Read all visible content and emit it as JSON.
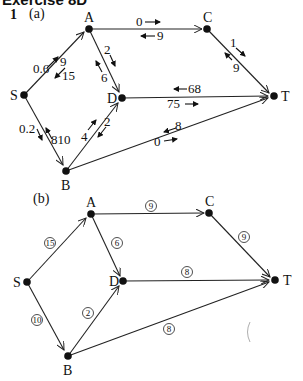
{
  "header": {
    "title": "Exercise 8D",
    "question_number": "1"
  },
  "part_a": {
    "label": "(a)",
    "nodes": [
      {
        "id": "A",
        "label": "A"
      },
      {
        "id": "C",
        "label": "C"
      },
      {
        "id": "S",
        "label": "S"
      },
      {
        "id": "D",
        "label": "D"
      },
      {
        "id": "T",
        "label": "T"
      },
      {
        "id": "B",
        "label": "B"
      }
    ],
    "edges": [
      {
        "from": "S",
        "to": "A",
        "forward": "0 6",
        "backward": "9 15"
      },
      {
        "from": "A",
        "to": "C",
        "forward": "0",
        "backward": "9"
      },
      {
        "from": "A",
        "to": "D",
        "forward": "2",
        "backward": "6"
      },
      {
        "from": "C",
        "to": "T",
        "forward": "1",
        "backward": "9"
      },
      {
        "from": "D",
        "to": "T",
        "forward": "7 5",
        "backward": "6 8"
      },
      {
        "from": "S",
        "to": "B",
        "forward": "0 2",
        "backward": "8 10"
      },
      {
        "from": "B",
        "to": "D",
        "forward": "4",
        "backward": "2"
      },
      {
        "from": "B",
        "to": "T",
        "forward": "0",
        "backward": "8"
      }
    ],
    "text": {
      "sa_fwd": "0.6",
      "sa_bwd1": "9",
      "sa_bwd2": "15",
      "ac_fwd": "0",
      "ac_bwd": "9",
      "ad_fwd": "2",
      "ad_bwd": "6",
      "ct_fwd": "1",
      "ct_bwd": "9",
      "dt_bwd": "68",
      "dt_fwd": "75",
      "sb_fwd": "0.2",
      "sb_bwd": "810",
      "bd_fwd": "4",
      "bd_bwd": "2",
      "bt_bwd": "8",
      "bt_fwd": "0"
    }
  },
  "part_b": {
    "label": "(b)",
    "nodes": [
      {
        "id": "A",
        "label": "A"
      },
      {
        "id": "C",
        "label": "C"
      },
      {
        "id": "S",
        "label": "S"
      },
      {
        "id": "D",
        "label": "D"
      },
      {
        "id": "T",
        "label": "T"
      },
      {
        "id": "B",
        "label": "B"
      }
    ],
    "edges": [
      {
        "from": "S",
        "to": "A",
        "flow": "15"
      },
      {
        "from": "A",
        "to": "C",
        "flow": "9"
      },
      {
        "from": "A",
        "to": "D",
        "flow": "6"
      },
      {
        "from": "C",
        "to": "T",
        "flow": "9"
      },
      {
        "from": "D",
        "to": "T",
        "flow": "8"
      },
      {
        "from": "S",
        "to": "B",
        "flow": "10"
      },
      {
        "from": "B",
        "to": "D",
        "flow": "2"
      },
      {
        "from": "B",
        "to": "T",
        "flow": "8"
      }
    ]
  }
}
